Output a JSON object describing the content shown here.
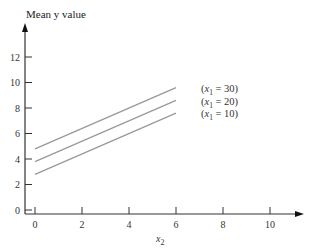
{
  "chart_data": {
    "type": "line",
    "title": "",
    "ylabel": "Mean y value",
    "xlabel": "x2",
    "xlabel_base": "x",
    "xlabel_sub": "2",
    "xlim": [
      0,
      11
    ],
    "ylim": [
      0,
      13
    ],
    "x_ticks": [
      0,
      2,
      4,
      6,
      8,
      10
    ],
    "y_ticks": [
      0,
      2,
      4,
      6,
      8,
      10,
      12
    ],
    "grid": false,
    "legend_position": "inline-right",
    "series": [
      {
        "name": "(x1 = 30)",
        "label_sub": "1",
        "label_value": "30",
        "x": [
          0,
          6
        ],
        "y": [
          4.8,
          9.6
        ]
      },
      {
        "name": "(x1 = 20)",
        "label_sub": "1",
        "label_value": "20",
        "x": [
          0,
          6
        ],
        "y": [
          3.8,
          8.6
        ]
      },
      {
        "name": "(x1 = 10)",
        "label_sub": "1",
        "label_value": "10",
        "x": [
          0,
          6
        ],
        "y": [
          2.8,
          7.6
        ]
      }
    ],
    "colors": {
      "axis": "#333333",
      "line": "#999999"
    }
  }
}
